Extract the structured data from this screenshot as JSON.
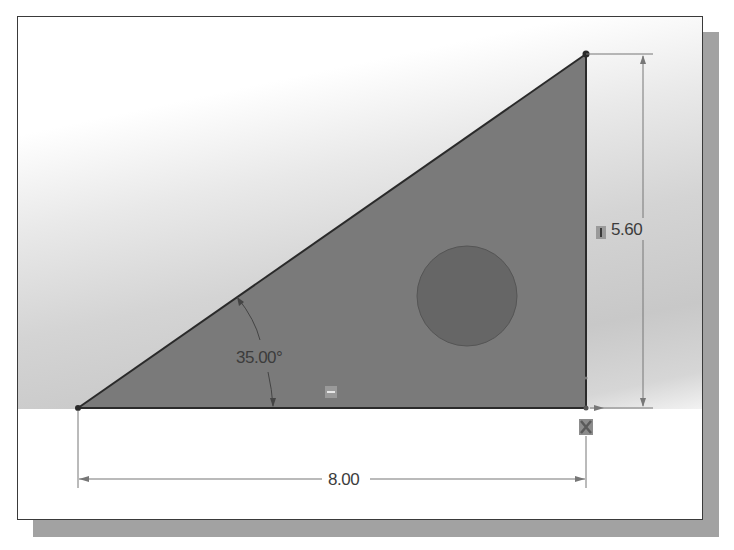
{
  "sketch": {
    "type": "right-triangle-with-hole",
    "colors": {
      "face_fill": "#7a7a7a",
      "hole_fill": "#666666",
      "edge_stroke": "#2a2a2a",
      "dimension_line": "#777777",
      "background_top": "#ffffff",
      "background_bottom": "#c8c8c8",
      "frame_shadow": "#a2a2a2"
    },
    "vertices": {
      "bottom_left": [
        78,
        408
      ],
      "top_right": [
        586,
        54
      ],
      "bottom_right": [
        586,
        408
      ]
    },
    "hole": {
      "center": [
        467,
        296
      ],
      "radius": 50
    }
  },
  "dimensions": {
    "height": {
      "label": "5.60",
      "icon": "vertical-relation-icon"
    },
    "angle": {
      "label": "35.00°"
    },
    "width": {
      "label": "8.00"
    }
  },
  "relations": {
    "horizontal": {
      "icon": "horizontal-relation-icon",
      "glyph": "–"
    },
    "vertical": {
      "icon": "vertical-relation-icon",
      "glyph": "I"
    },
    "fixed": {
      "icon": "fixed-relation-icon"
    }
  }
}
